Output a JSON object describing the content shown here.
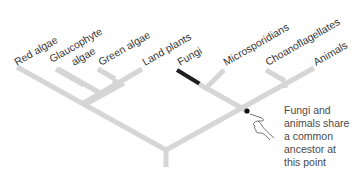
{
  "diagram": {
    "type": "phylogenetic-tree",
    "taxa": [
      {
        "label": "Red algae",
        "x": 17,
        "y": 69
      },
      {
        "label": "Glaucophyte",
        "label2": "algae",
        "x": 56,
        "y": 69
      },
      {
        "label": "Green algae",
        "x": 98,
        "y": 69
      },
      {
        "label": "Land plants",
        "x": 142,
        "y": 69
      },
      {
        "label": "Fungi",
        "x": 177,
        "y": 69,
        "highlight": true
      },
      {
        "label": "Microsporidians",
        "x": 223,
        "y": 69
      },
      {
        "label": "Choanoflagellates",
        "x": 263,
        "y": 69
      },
      {
        "label": "Animals",
        "x": 312,
        "y": 69
      }
    ],
    "callout": {
      "lines": [
        "Fungi and",
        "animals share",
        "a common",
        "ancestor at",
        "this point"
      ]
    },
    "colors": {
      "branch": "#d6d6d6",
      "highlight_branch": "#1f1f1f",
      "text": "#333333",
      "node_dot": "#111111"
    }
  }
}
